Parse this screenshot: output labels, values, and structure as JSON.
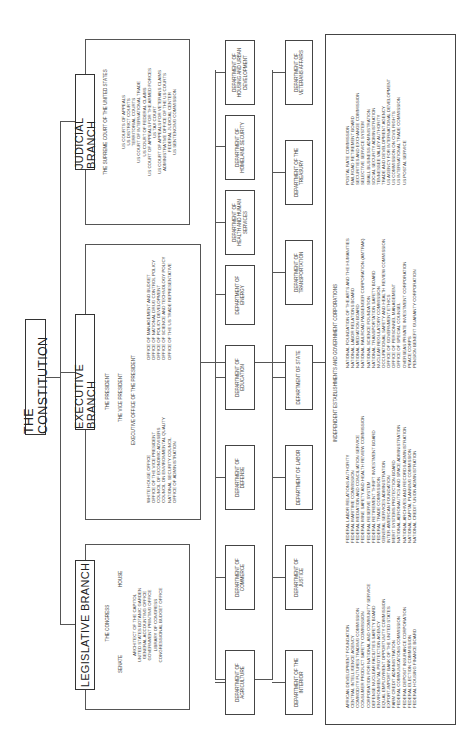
{
  "constitution": {
    "label": "THE CONSTITUTION"
  },
  "legislative": {
    "label": "LEGISLATIVE BRANCH",
    "congress": "THE CONGRESS",
    "senate": "SENATE",
    "house": "HOUSE",
    "offices": [
      "ARCHITECT OF THE CAPITOL",
      "UNITED STATES BOTANIC GARDEN",
      "GENERAL ACCOUNTING OFFICE",
      "GOVERNMENT PRINTING OFFICE",
      "LIBRARY OF CONGRESS",
      "CONGRESSIONAL BUDGET OFFICE"
    ]
  },
  "executive": {
    "label": "EXECUTIVE BRANCH",
    "president": "THE PRESIDENT",
    "vice_president": "THE VICE PRESIDENT",
    "eop": "EXECUTIVE OFFICE OF THE PRESIDENT",
    "offices_left": [
      "WHITE HOUSE OFFICE",
      "OFFICE OF THE VICE PRESIDENT",
      "COUNCIL OF ECONOMIC ADVISERS",
      "COUNCIL ON ENVIRONMENTAL QUALITY",
      "NATIONAL SECURITY COUNCIL",
      "OFFICE OF ADMINISTRATION"
    ],
    "offices_right": [
      "OFFICE OF MANAGEMENT AND BUDGET",
      "OFFICE OF NATIONAL DRUG CONTROL POLICY",
      "OFFICE OF POLICY DEVELOPMENT",
      "OFFICE OF SCIENCE AND TECHNOLOGY POLICY",
      "OFFICE OF THE US TRADE REPRESENTATIVE"
    ]
  },
  "judicial": {
    "label": "JUDICIAL BRANCH",
    "supreme": "THE SUPREME COURT OF THE UNITED STATES",
    "courts": [
      "US COURTS OF APPEALS",
      "US DISTRICT COURTS",
      "TERRITORIAL COURTS",
      "US COURT OF INTERNATIONAL TRADE",
      "US COURT OF FEDERAL CLAIMS",
      "US COURT OF APPEALS FOR THE ARMED FORCES",
      "US TAX COURT",
      "US COURT OF APPEALS FOR VETERANS CLAIMS",
      "ADMINISTRATIVE OFFICE OF THE US COURTS",
      "FEDERAL JUDICIAL CENTER",
      "US SENTENCING COMMISSION"
    ]
  },
  "departments_row1": [
    "DEPARTMENT OF AGRICULTURE",
    "DEPARTMENT OF COMMERCE",
    "DEPARTMENT OF DEFENSE",
    "DEPARTMENT OF EDUCATION",
    "DEPARTMENT OF ENERGY",
    "DEPARTMENT OF HEALTH AND HUMAN SERVICES",
    "DEPARTMENT OF HOMELAND SECURITY",
    "DEPARTMENT OF HOUSING AND URBAN DEVELOPMENT"
  ],
  "departments_row2": [
    "DEPARTMENT OF THE INTERIOR",
    "DEPARTMENT OF JUSTICE",
    "DEPARTMENT OF LABOR",
    "DEPARTMENT OF STATE",
    "DEPARTMENT OF TRANSPORTATION",
    "DEPARTMENT OF THE TREASURY",
    "DEPARTMENT OF VETERANS AFFAIRS"
  ],
  "independent": {
    "title": "INDEPENDENT ESTABLISHMENTS AND GOVERNMENT CORPORATIONS",
    "col1": [
      "AFRICAN DEVELOPMENT FOUNDATION",
      "CENTRAL INTELLIGENCE AGENCY",
      "COMMODITY FUTURES TRADING COMMISSION",
      "CONSUMER PRODUCT SAFETY COMMISSION",
      "CORPORATION FOR NATIONAL AND COMMUNITY SERVICE",
      "DEFENSE NUCLEAR FACILITIES SAFETY BOARD",
      "ENVIRONMENTAL PROTECTION AGENCY",
      "EQUAL EMPLOYMENT OPPORTUNITY COMMISSION",
      "EXPORT-IMPORT BANK OF THE UNITED STATES",
      "FARM CREDIT ADMINISTRATION",
      "FEDERAL COMMUNICATIONS COMMISSION",
      "FEDERAL DEPOSIT INSURANCE CORPORATION",
      "FEDERAL ELECTION COMMISSION",
      "FEDERAL HOUSING FINANCE BOARD"
    ],
    "col2": [
      "FEDERAL LABOR RELATIONS AUTHORITY",
      "FEDERAL MARITIME COMMISSION",
      "FEDERAL MEDIATION AND CONCILIATION SERVICE",
      "FEDERAL MINE SAFETY AND HEALTH REVIEW COMMISSION",
      "FEDERAL RESERVE SYSTEM",
      "FEDERAL RETIREMENT THRIFT INVESTMENT BOARD",
      "FEDERAL TRADE COMMISSION",
      "GENERAL SERVICES ADMINISTRATION",
      "INTER-AMERICAN FOUNDATION",
      "MERIT SYSTEMS PROTECTION BOARD",
      "NATIONAL AERONAUTICS AND SPACE ADMINISTRATION",
      "NATIONAL ARCHIVES AND RECORDS ADMINISTRATION",
      "NATIONAL CAPITAL PLANNING COMMISSION",
      "NATIONAL CREDIT UNION ADMINISTRATION"
    ],
    "col3": [
      "NATIONAL FOUNDATION OF THE ARTS AND THE HUMANITIES",
      "NATIONAL LABOR RELATIONS BOARD",
      "NATIONAL MEDIATION BOARD",
      "NATIONAL RAILROAD PASSENGER CORPORATION (AMTRAK)",
      "NATIONAL SCIENCE FOUNDATION",
      "NATIONAL TRANSPORTATION SAFETY BOARD",
      "NUCLEAR REGULATORY COMMISSION",
      "OCCUPATIONAL SAFETY AND HEALTH REVIEW COMMISSION",
      "OFFICE OF GOVERNMENT ETHICS",
      "OFFICE OF PERSONNEL MANAGEMENT",
      "OFFICE OF SPECIAL COUNSEL",
      "OVERSEAS PRIVATE INVESTMENT CORPORATION",
      "PEACE CORPS",
      "PENSION BENEFIT GUARANTY CORPORATION"
    ],
    "col4": [
      "POSTAL RATE COMMISSION",
      "RAILROAD RETIREMENT BOARD",
      "SECURITIES AND EXCHANGE COMMISSION",
      "SELECTIVE SERVICE SYSTEM",
      "SMALL BUSINESS ADMINISTRATION",
      "SOCIAL SECURITY ADMINISTRATION",
      "TENNESSEE VALLEY AUTHORITY",
      "TRADE AND DEVELOPMENT AGENCY",
      "US AGENCY FOR INTERNATIONAL DEVELOPMENT",
      "US COMMISSION ON CIVIL RIGHTS",
      "US INTERNATIONAL TRADE COMMISSION",
      "US POSTAL SERVICE"
    ]
  }
}
